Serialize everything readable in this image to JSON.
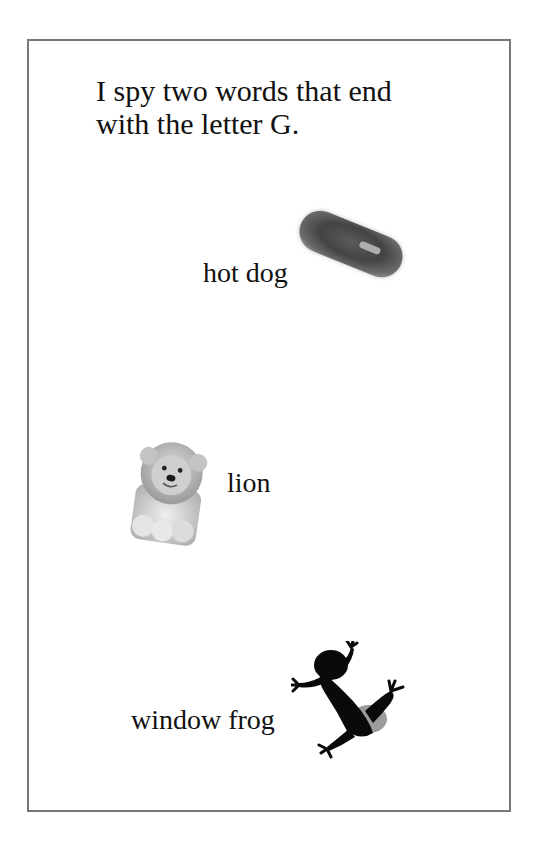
{
  "page": {
    "prompt_line_1": "I spy two words that end",
    "prompt_line_2": "with the letter G.",
    "frame_border_color": "#777777"
  },
  "items": [
    {
      "label": "hot dog",
      "picture": "hot-dog-picture"
    },
    {
      "label": "lion",
      "picture": "lion-toy-picture"
    },
    {
      "label": "window frog",
      "picture": "frog-silhouette-picture"
    }
  ]
}
